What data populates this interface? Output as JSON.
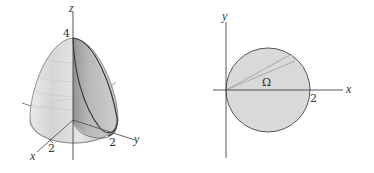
{
  "figure_left": {
    "type": "3d-solid",
    "description": "Paraboloid solid with cylinder cut",
    "axes": {
      "x_label": "x",
      "y_label": "y",
      "z_label": "z"
    },
    "ticks": {
      "z_top": "4",
      "x_tick": "2",
      "y_tick": "2"
    }
  },
  "figure_right": {
    "type": "2d-region",
    "axes": {
      "x_label": "x",
      "y_label": "y"
    },
    "region_label": "Ω",
    "x_tick": "2"
  },
  "colors": {
    "axis": "#555555",
    "region_fill": "#d9d9d9",
    "outline": "#444444",
    "surface_light": "#e6e6e6",
    "surface_dark": "#9a9a9a"
  }
}
